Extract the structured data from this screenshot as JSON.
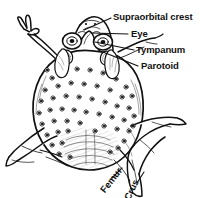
{
  "figure": {
    "view": "dorsal",
    "style": "black-and-white line drawing",
    "background_color": "#ffffff",
    "ink_color": "#111111"
  },
  "labels": {
    "supraorbital_crest": "Supraorbital crest",
    "eye": "Eye",
    "tympanum": "Tympanum",
    "parotoid": "Parotoid",
    "femur": "Femur",
    "crus": "Crus"
  },
  "callouts": [
    {
      "name": "supraorbital-crest",
      "text": "Supraorbital crest",
      "text_x": 113,
      "text_y": 12,
      "leader_from_x": 111,
      "leader_from_y": 18,
      "leader_to_x": 84,
      "leader_to_y": 30
    },
    {
      "name": "eye",
      "text": "Eye",
      "text_x": 131,
      "text_y": 29,
      "leader_from_x": 128,
      "leader_from_y": 34,
      "leader_to_x": 92,
      "leader_to_y": 33
    },
    {
      "name": "tympanum",
      "text": "Tympanum",
      "text_x": 136,
      "text_y": 45,
      "leader_from_x": 134,
      "leader_from_y": 50,
      "leader_to_x": 95,
      "leader_to_y": 42
    },
    {
      "name": "parotoid",
      "text": "Parotoid",
      "text_x": 141,
      "text_y": 61,
      "leader_from_x": 138,
      "leader_from_y": 66,
      "leader_to_x": 98,
      "leader_to_y": 50
    }
  ],
  "rotated_labels": [
    {
      "name": "femur",
      "text": "Femur",
      "x": 106,
      "y": 185,
      "rotation_deg": -52
    },
    {
      "name": "crus",
      "text": "Crus",
      "x": 131,
      "y": 192,
      "rotation_deg": -64
    }
  ],
  "anatomy_parts": [
    "supraorbital crest",
    "eye",
    "tympanum",
    "parotoid gland",
    "femur",
    "crus",
    "forelimb",
    "hindlimb",
    "warty dorsal skin"
  ]
}
